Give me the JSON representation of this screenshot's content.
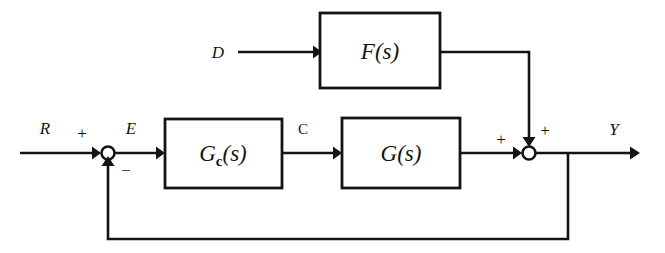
{
  "figure": {
    "type": "control-system-block-diagram",
    "background_color": "#ffffff",
    "line_color": "#141414"
  },
  "blocks": [
    {
      "id": "feedforward",
      "label": "F(s)",
      "label_main": "F",
      "label_args": "(s)",
      "x": 320,
      "y": 13,
      "w": 120,
      "h": 75
    },
    {
      "id": "controller",
      "label": "Gc(s)",
      "label_main": "G",
      "label_sub": "c",
      "label_args": "(s)",
      "x": 165,
      "y": 119,
      "w": 117,
      "h": 69
    },
    {
      "id": "plant",
      "label": "G(s)",
      "label_main": "G",
      "label_args": "(s)",
      "x": 342,
      "y": 118,
      "w": 118,
      "h": 70
    }
  ],
  "signals": {
    "reference": "R",
    "disturbance": "D",
    "error": "E",
    "control": "C",
    "output": "Y"
  },
  "summing_junctions": [
    {
      "id": "error-junction",
      "cx": 108,
      "cy": 153,
      "r": 6.5,
      "signs": [
        {
          "text": "+",
          "x": 82,
          "y": 133,
          "input": "reference"
        },
        {
          "text": "−",
          "x": 124,
          "y": 172,
          "input": "feedback"
        }
      ]
    },
    {
      "id": "output-junction",
      "cx": 529,
      "cy": 153,
      "r": 6.5,
      "signs": [
        {
          "text": "+",
          "x": 501,
          "y": 141,
          "input": "plant-output"
        },
        {
          "text": "+",
          "x": 543,
          "y": 131,
          "input": "feedforward-output"
        }
      ]
    }
  ],
  "labels": [
    {
      "name": "reference-label",
      "text": "R",
      "x": 45,
      "y": 134,
      "style": "italic"
    },
    {
      "name": "error-label",
      "text": "E",
      "x": 131,
      "y": 134,
      "style": "italic"
    },
    {
      "name": "control-label",
      "text": "C",
      "x": 300,
      "y": 134,
      "style": "upright"
    },
    {
      "name": "disturbance-label",
      "text": "D",
      "x": 214,
      "y": 58,
      "style": "italic"
    },
    {
      "name": "output-label",
      "text": "Y",
      "x": 611,
      "y": 135,
      "style": "italic"
    }
  ],
  "wires": {
    "main_line_y": 153,
    "feedforward_line_y": 52,
    "feedback_line_y": 239,
    "feedback_tap_x": 568,
    "feedforward_drop_x": 529,
    "input_start_x": 20,
    "output_end_x": 640,
    "disturbance_start_x": 238
  }
}
